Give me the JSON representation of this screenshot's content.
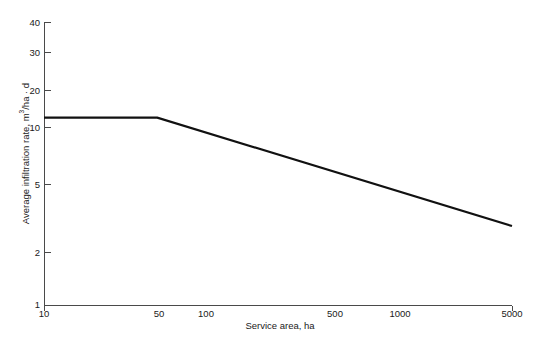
{
  "chart_data": {
    "type": "line",
    "title": "",
    "xlabel": "Service area, ha",
    "ylabel": "Average infiltration rate, m3/ha · d",
    "ylabel_parts": {
      "pre": "Average infiltration rate, m",
      "sup": "3",
      "post": "/ha · d"
    },
    "xscale": "log",
    "yscale": "log",
    "xlim": [
      10,
      5000
    ],
    "ylim": [
      1,
      40
    ],
    "grid": false,
    "legend": null,
    "xticks": [
      {
        "value": 10,
        "label": "10"
      },
      {
        "value": 50,
        "label": "50"
      },
      {
        "value": 100,
        "label": "100"
      },
      {
        "value": 500,
        "label": "500"
      },
      {
        "value": 1000,
        "label": "1000"
      },
      {
        "value": 5000,
        "label": "5000"
      }
    ],
    "yticks": [
      {
        "value": 1,
        "label": "1"
      },
      {
        "value": 2,
        "label": "2"
      },
      {
        "value": 5,
        "label": "5"
      },
      {
        "value": 10,
        "label": "10"
      },
      {
        "value": 20,
        "label": "20"
      },
      {
        "value": 30,
        "label": "30"
      },
      {
        "value": 40,
        "label": "40"
      }
    ],
    "series": [
      {
        "name": "Average infiltration rate",
        "color": "#111111",
        "linewidth": 2.2,
        "x": [
          10,
          45,
          5000
        ],
        "y": [
          11.5,
          11.5,
          2.8
        ]
      }
    ],
    "annotations": []
  }
}
